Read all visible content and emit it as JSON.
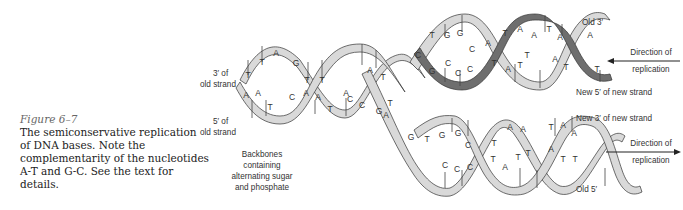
{
  "caption": {
    "figure_label": "Figure 6–7",
    "text": "The semiconservative replication of DNA bases. Note the complementarity of the nucleotides A-T and G-C. See the text for details."
  },
  "labels": {
    "left_top_line1": "3′ of",
    "left_top_line2": "old strand",
    "left_bottom_line1": "5′ of",
    "left_bottom_line2": "old strand",
    "backbone_line1": "Backbones",
    "backbone_line2": "containing",
    "backbone_line3": "alternating sugar",
    "backbone_line4": "and phosphate",
    "old_3": "Old 3′",
    "new_5": "New 5′ of new strand",
    "new_3": "New 3′ of new strand",
    "old_5": "Old 5′",
    "direction_top_line1": "Direction of",
    "direction_top_line2": "replication",
    "direction_bottom_line1": "Direction of",
    "direction_bottom_line2": "replication"
  },
  "colors": {
    "light_strand": "#d9d9d9",
    "dark_strand": "#6e6e6e",
    "outline": "#333333"
  },
  "bases": {
    "parent_top": [
      "T",
      "T",
      "A",
      "G",
      "T",
      "T",
      "T",
      "C",
      "A",
      "T"
    ],
    "parent_bottom": [
      "A",
      "A",
      "T",
      "C",
      "A",
      "A",
      "A",
      "C",
      "G",
      "T",
      "A"
    ],
    "upper_daughter_top": [
      "C",
      "T",
      "G",
      "G",
      "C",
      "A",
      "T",
      "A",
      "A",
      "T",
      "A",
      "A"
    ],
    "upper_daughter_bottom": [
      "C",
      "C",
      "C",
      "G",
      "T",
      "A",
      "T",
      "T",
      "A",
      "T",
      "T"
    ],
    "lower_daughter_top": [
      "G",
      "T",
      "G",
      "G",
      "C",
      "T",
      "A",
      "A",
      "T",
      "A",
      "A"
    ],
    "lower_daughter_bottom": [
      "C",
      "C",
      "C",
      "T",
      "A",
      "T",
      "T",
      "A",
      "T",
      "T"
    ]
  }
}
